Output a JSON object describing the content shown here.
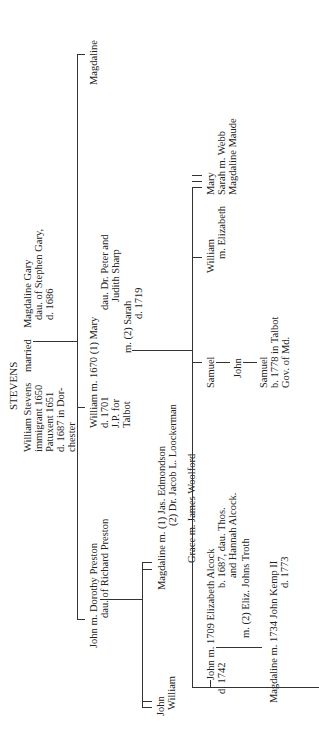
{
  "title": "STEVENS",
  "generation1": {
    "husband": [
      "William Stevens",
      "immigrant 1650",
      "Patuxent 1651",
      "d. 1687 in Dor-",
      "chester"
    ],
    "married_label": "married",
    "wife": [
      "Magdaline Gary",
      "dau. of Stephen Gary,",
      "d. 1686"
    ]
  },
  "generation2": {
    "john": {
      "line1": "John m. Dorothy Preston",
      "line2": "dau. of Richard Preston"
    },
    "william": [
      "William m. 1670 (1) Mary",
      "d. 1701",
      "J.P. for",
      "Talbot"
    ],
    "william_wife1_detail": [
      "dau. Dr. Peter and",
      "Judith Sharp"
    ],
    "william_wife2": [
      "m. (2) Sarah",
      "d. 1719"
    ],
    "magdaline": "Magdaline"
  },
  "generation3_john": {
    "john": "John",
    "william": "William",
    "magdaline": [
      "Magdaline m. (1) Jas. Edmondson",
      "(2) Dr. Jacob L. Loockerman"
    ],
    "grace": "Grace m. James Woolford"
  },
  "generation3_william": {
    "john": [
      "John m. 1709 Elizabeth Alcock",
      "d. 1742"
    ],
    "john_wife_detail": [
      "b. 1687, dau. Thos.",
      "and Hannah Alcock."
    ],
    "john_wife2": "m. (2) Eliz. Johns Troth",
    "samuel": "Samuel",
    "william": [
      "William",
      "m. Elizabeth"
    ],
    "mary": "Mary",
    "sarah": "Sarah m. Webb",
    "magdaline_maude": "Magdaline Maude"
  },
  "generation4": {
    "magdaline": [
      "Magdaline m. 1734 John Kemp II",
      "d. 1773"
    ],
    "john": "John"
  },
  "generation5": {
    "samuel": [
      "Samuel",
      "b. 1778 in Talbot",
      "Gov. of Md."
    ]
  }
}
